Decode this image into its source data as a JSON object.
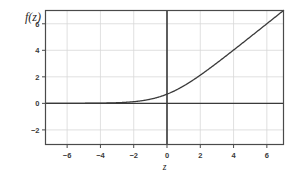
{
  "chart_data": {
    "type": "line",
    "title": "",
    "subtitle": "",
    "xlabel": "z",
    "ylabel": "f(z)",
    "xlim": [
      -7.3,
      7.0
    ],
    "ylim": [
      -3.1,
      7.0
    ],
    "xticks": [
      -6,
      -4,
      -2,
      0,
      2,
      4,
      6
    ],
    "xtick_labels": [
      "−6",
      "−4",
      "−2",
      "0",
      "2",
      "4",
      "6"
    ],
    "yticks": [
      -2,
      0,
      2,
      4,
      6
    ],
    "ytick_labels": [
      "−2",
      "0",
      "2",
      "4",
      "6"
    ],
    "grid": true,
    "grid_color": "#d8d8d8",
    "legend": null,
    "legend_position": "none",
    "series": [
      {
        "name": "softplus",
        "formula": "f(z) = ln(1 + e^z)",
        "color": "#3a3a3a",
        "linewidth": 1.3,
        "x": [
          -7.3,
          -7.0,
          -6.5,
          -6.0,
          -5.5,
          -5.0,
          -4.5,
          -4.0,
          -3.5,
          -3.0,
          -2.5,
          -2.0,
          -1.5,
          -1.0,
          -0.5,
          0.0,
          0.5,
          1.0,
          1.5,
          2.0,
          2.5,
          3.0,
          3.5,
          4.0,
          4.5,
          5.0,
          5.5,
          6.0,
          6.5,
          7.0
        ],
        "y": [
          0.001,
          0.001,
          0.002,
          0.002,
          0.004,
          0.007,
          0.011,
          0.018,
          0.03,
          0.049,
          0.079,
          0.127,
          0.201,
          0.313,
          0.474,
          0.693,
          0.974,
          1.313,
          1.701,
          2.127,
          2.579,
          3.049,
          3.53,
          4.018,
          4.511,
          5.007,
          5.504,
          6.002,
          6.502,
          7.001
        ]
      }
    ],
    "axis_lines": {
      "vertical_at_x": 0,
      "horizontal_at_y": 0,
      "color": "#3a3a3a"
    },
    "frame": {
      "color": "#4a4a4a",
      "visible": true
    },
    "background": "#ffffff"
  },
  "figure": {
    "ylabel": "f(z)",
    "xlabel": "z"
  }
}
